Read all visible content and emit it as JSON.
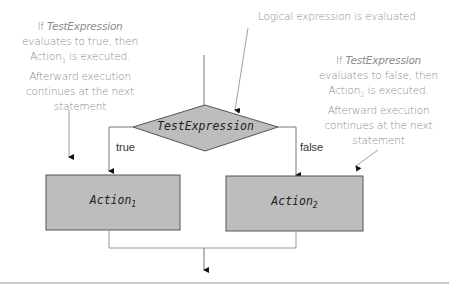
{
  "diagram": {
    "type": "if-else flowchart",
    "colors": {
      "shape_fill": "#bdbdbd",
      "shape_stroke": "#555555",
      "line": "#777777",
      "note_text": "#8c8c8c",
      "rule": "#c9c9c9"
    },
    "decision": {
      "label": "TestExpression"
    },
    "branches": {
      "true_label": "true",
      "false_label": "false"
    },
    "actions": [
      {
        "name": "Action",
        "subscript": "1"
      },
      {
        "name": "Action",
        "subscript": "2"
      }
    ],
    "notes": {
      "top_center": "Logical expression is evaluated",
      "left": {
        "line1_pre": "If ",
        "line1_em": "TestExpression",
        "line2": "evaluates to true, then",
        "line3_pre": "Action",
        "line3_sub": "1",
        "line3_post": " is executed.",
        "line4": "Afterward execution",
        "line5": "continues at the next",
        "line6": "statement"
      },
      "right": {
        "line1_pre": "If ",
        "line1_em": "TestExpression",
        "line2": "evaluates to false, then",
        "line3_pre": "Action",
        "line3_sub": "2",
        "line3_post": " is executed.",
        "line4": "Afterward execution",
        "line5": "continues at the next",
        "line6": "statement"
      }
    }
  }
}
